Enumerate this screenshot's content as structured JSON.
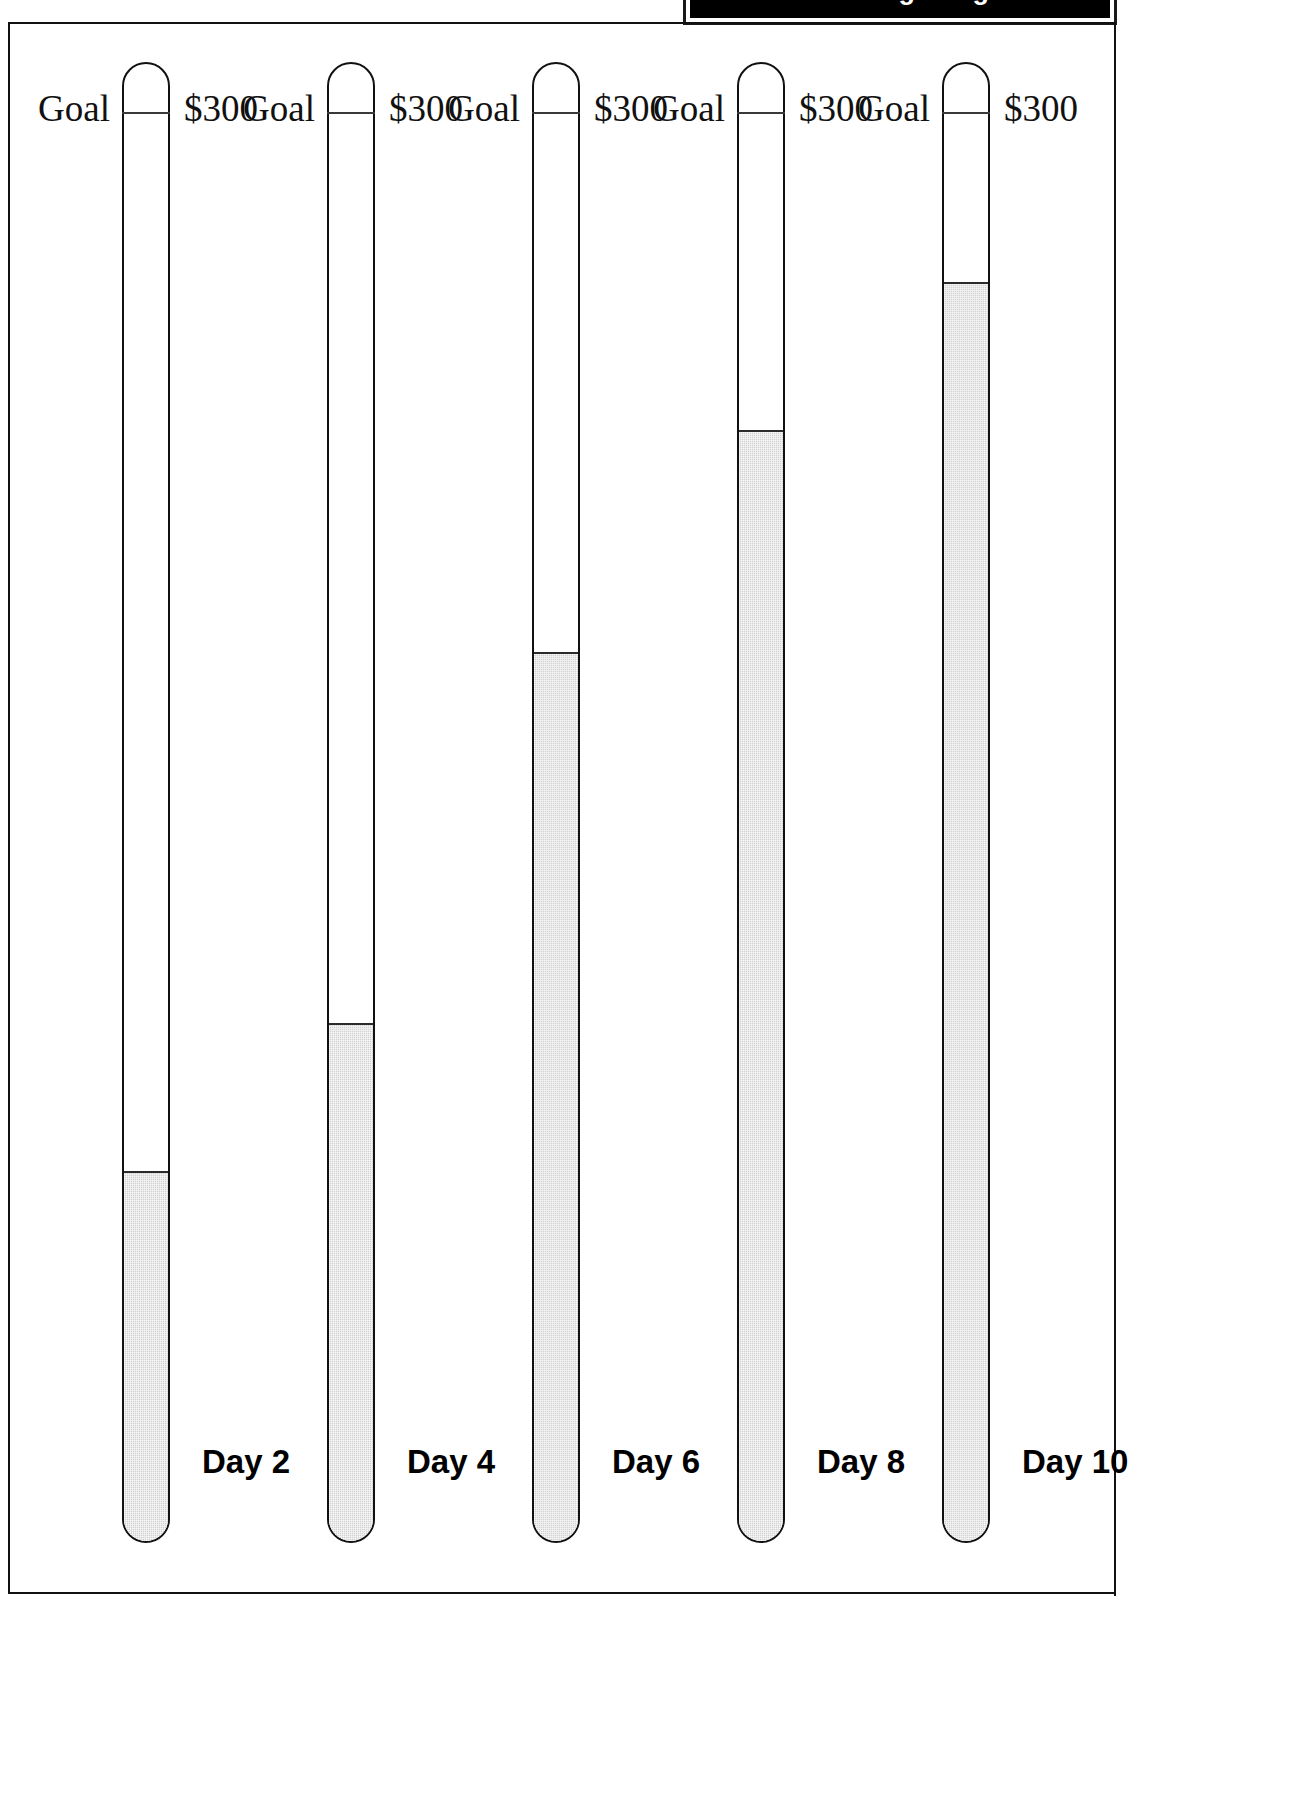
{
  "banner": {
    "text": "Fundraising Progress",
    "visible_portion": "clipped-top"
  },
  "page": {
    "background": "#ffffff",
    "border_color": "#111111"
  },
  "chart_data": {
    "type": "bar",
    "title": "",
    "subtitle": "",
    "xlabel": "",
    "ylabel": "",
    "orientation": "vertical",
    "style": "thermometer-gauge",
    "goal_label": "Goal",
    "goal_amount_label": "$300",
    "goal_value": 300,
    "ylim": [
      0,
      300
    ],
    "grid": false,
    "legend": false,
    "units": "USD",
    "categories": [
      "Day 2",
      "Day 4",
      "Day 6",
      "Day 8",
      "Day 10"
    ],
    "values": [
      75,
      105,
      180,
      225,
      255
    ],
    "fill_fraction": [
      0.25,
      0.35,
      0.6,
      0.75,
      0.85
    ],
    "fill_color": "#d2d2d2",
    "outline_color": "#111111"
  },
  "thermometers": [
    {
      "goal": "Goal",
      "amount": "$300",
      "day": "Day 2",
      "fill_percent": "25%"
    },
    {
      "goal": "Goal",
      "amount": "$300",
      "day": "Day 4",
      "fill_percent": "35%"
    },
    {
      "goal": "Goal",
      "amount": "$300",
      "day": "Day 6",
      "fill_percent": "60%"
    },
    {
      "goal": "Goal",
      "amount": "$300",
      "day": "Day 8",
      "fill_percent": "75%"
    },
    {
      "goal": "Goal",
      "amount": "$300",
      "day": "Day 10",
      "fill_percent": "85%"
    }
  ]
}
